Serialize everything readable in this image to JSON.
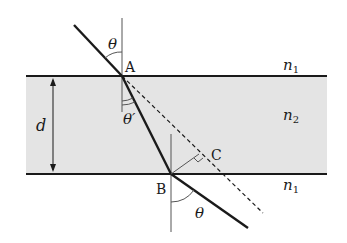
{
  "diagram": {
    "colors": {
      "background": "#ffffff",
      "slab_fill": "#e4e4e4",
      "line": "#1a1a1a",
      "normal": "#555555"
    },
    "labels": {
      "point_a": "A",
      "point_b": "B",
      "point_c": "C",
      "incident_angle": "θ",
      "refracted_angle": "θ′",
      "exit_angle": "θ",
      "thickness": "d",
      "medium_top": "n",
      "medium_top_sub": "1",
      "medium_slab": "n",
      "medium_slab_sub": "2",
      "medium_bottom": "n",
      "medium_bottom_sub": "1"
    }
  }
}
